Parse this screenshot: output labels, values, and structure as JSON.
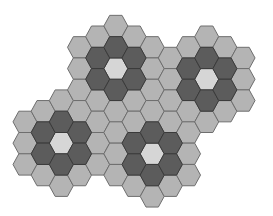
{
  "diagram": {
    "title": "",
    "geometry": {
      "origin_x": 25,
      "col_spacing": 18.17,
      "row_height": 21.3,
      "odd_col_y0": 26,
      "even_col_y0": 15.35,
      "outer_radius": 12,
      "half_top_edge": 6.17
    },
    "colors": {
      "m": "#b4b4b4",
      "d": "#5c5c5c",
      "l": "#d6d6d6",
      "stroke_m": "#6e6e6e",
      "stroke_d": "#3a3a3a",
      "stroke_l": "#5a5a5a",
      "background": "#ffffff"
    },
    "columns": [
      {
        "col": 0,
        "cells": [
          [
            5,
            "m"
          ],
          [
            6,
            "m"
          ],
          [
            7,
            "m"
          ]
        ]
      },
      {
        "col": 1,
        "cells": [
          [
            4,
            "m"
          ],
          [
            5,
            "d"
          ],
          [
            6,
            "d"
          ],
          [
            7,
            "m"
          ]
        ]
      },
      {
        "col": 2,
        "cells": [
          [
            4,
            "m"
          ],
          [
            5,
            "d"
          ],
          [
            6,
            "l"
          ],
          [
            7,
            "d"
          ],
          [
            8,
            "m"
          ]
        ]
      },
      {
        "col": 3,
        "cells": [
          [
            1,
            "m"
          ],
          [
            2,
            "m"
          ],
          [
            3,
            "m"
          ],
          [
            4,
            "m"
          ],
          [
            5,
            "d"
          ],
          [
            6,
            "d"
          ],
          [
            7,
            "m"
          ]
        ]
      },
      {
        "col": 4,
        "cells": [
          [
            1,
            "m"
          ],
          [
            2,
            "d"
          ],
          [
            3,
            "d"
          ],
          [
            4,
            "m"
          ],
          [
            5,
            "m"
          ],
          [
            6,
            "m"
          ],
          [
            7,
            "m"
          ]
        ]
      },
      {
        "col": 5,
        "cells": [
          [
            0,
            "m"
          ],
          [
            1,
            "d"
          ],
          [
            2,
            "l"
          ],
          [
            3,
            "d"
          ],
          [
            4,
            "m"
          ],
          [
            5,
            "m"
          ],
          [
            6,
            "m"
          ],
          [
            7,
            "m"
          ]
        ]
      },
      {
        "col": 6,
        "cells": [
          [
            1,
            "m"
          ],
          [
            2,
            "d"
          ],
          [
            3,
            "d"
          ],
          [
            4,
            "m"
          ],
          [
            5,
            "m"
          ],
          [
            6,
            "d"
          ],
          [
            7,
            "d"
          ],
          [
            8,
            "m"
          ]
        ]
      },
      {
        "col": 7,
        "cells": [
          [
            1,
            "m"
          ],
          [
            2,
            "m"
          ],
          [
            3,
            "m"
          ],
          [
            4,
            "m"
          ],
          [
            5,
            "d"
          ],
          [
            6,
            "l"
          ],
          [
            7,
            "d"
          ],
          [
            8,
            "m"
          ]
        ]
      },
      {
        "col": 8,
        "cells": [
          [
            2,
            "m"
          ],
          [
            3,
            "m"
          ],
          [
            4,
            "m"
          ],
          [
            5,
            "m"
          ],
          [
            6,
            "d"
          ],
          [
            7,
            "d"
          ],
          [
            8,
            "m"
          ]
        ]
      },
      {
        "col": 9,
        "cells": [
          [
            1,
            "m"
          ],
          [
            2,
            "d"
          ],
          [
            3,
            "d"
          ],
          [
            4,
            "m"
          ],
          [
            5,
            "m"
          ],
          [
            6,
            "m"
          ],
          [
            7,
            "m"
          ]
        ]
      },
      {
        "col": 10,
        "cells": [
          [
            1,
            "m"
          ],
          [
            2,
            "d"
          ],
          [
            3,
            "l"
          ],
          [
            4,
            "d"
          ],
          [
            5,
            "m"
          ]
        ]
      },
      {
        "col": 11,
        "cells": [
          [
            1,
            "m"
          ],
          [
            2,
            "d"
          ],
          [
            3,
            "d"
          ],
          [
            4,
            "m"
          ]
        ]
      },
      {
        "col": 12,
        "cells": [
          [
            2,
            "m"
          ],
          [
            3,
            "m"
          ],
          [
            4,
            "m"
          ]
        ]
      }
    ],
    "flowers": [
      {
        "name": "top-left-flower",
        "center": [
          5,
          2
        ]
      },
      {
        "name": "top-right-flower",
        "center": [
          10,
          3
        ]
      },
      {
        "name": "bottom-left-flower",
        "center": [
          2,
          6
        ]
      },
      {
        "name": "bottom-center-flower",
        "center": [
          7,
          6
        ]
      }
    ]
  }
}
